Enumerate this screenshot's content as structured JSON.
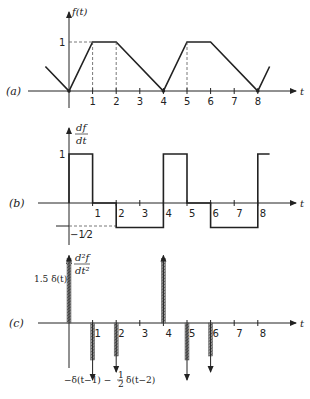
{
  "figure": {
    "panels": [
      {
        "id": "a",
        "label": "(a)",
        "ylabel": "f(t)",
        "xlabel": "t",
        "ytick_labels": [
          "1"
        ],
        "xtick_labels": [
          "1",
          "2",
          "3",
          "4",
          "5",
          "6",
          "7",
          "8"
        ],
        "points": [
          [
            -1,
            0.5
          ],
          [
            0,
            0
          ],
          [
            1,
            1
          ],
          [
            2,
            1
          ],
          [
            4,
            0
          ],
          [
            5,
            1
          ],
          [
            6,
            1
          ],
          [
            8,
            0
          ],
          [
            8.5,
            0.5
          ]
        ]
      },
      {
        "id": "b",
        "label": "(b)",
        "ylabel_num": "df",
        "ylabel_den": "dt",
        "xlabel": "t",
        "ytick_labels": [
          "1",
          "−1⁄2"
        ],
        "xtick_labels": [
          "1",
          "2",
          "3",
          "4",
          "5",
          "6",
          "7",
          "8"
        ],
        "segments": [
          {
            "from": 0,
            "to": 1,
            "value": 1
          },
          {
            "from": 1,
            "to": 2,
            "value": 0
          },
          {
            "from": 2,
            "to": 4,
            "value": -0.5
          },
          {
            "from": 4,
            "to": 5,
            "value": 1
          },
          {
            "from": 5,
            "to": 6,
            "value": 0
          },
          {
            "from": 6,
            "to": 8,
            "value": -0.5
          },
          {
            "from": 8,
            "to": 8.5,
            "value": 1
          }
        ]
      },
      {
        "id": "c",
        "label": "(c)",
        "ylabel_num": "d²f",
        "ylabel_den": "dt²",
        "xlabel": "t",
        "xtick_labels": [
          "1",
          "2",
          "3",
          "4",
          "5",
          "6",
          "7",
          "8"
        ],
        "impulses": [
          {
            "t": 0,
            "weight": 1.5
          },
          {
            "t": 1,
            "weight": -1
          },
          {
            "t": 2,
            "weight": -0.5
          },
          {
            "t": 4,
            "weight": 1.5
          },
          {
            "t": 5,
            "weight": -1
          },
          {
            "t": 6,
            "weight": -0.5
          }
        ],
        "annotations": {
          "top": "1.5 δ(t)",
          "bottom_a": "−δ(t−1) −",
          "bottom_frac_num": "1",
          "bottom_frac_den": "2",
          "bottom_b": "δ(t−2)"
        }
      }
    ]
  },
  "chart_data": [
    {
      "type": "line",
      "title": "(a) f(t)",
      "xlabel": "t",
      "ylabel": "f(t)",
      "x": [
        -1,
        0,
        1,
        2,
        4,
        5,
        6,
        8,
        8.5
      ],
      "values": [
        0.5,
        0,
        1,
        1,
        0,
        1,
        1,
        0,
        0.5
      ],
      "ylim": [
        0,
        1
      ]
    },
    {
      "type": "line",
      "title": "(b) df/dt",
      "xlabel": "t",
      "ylabel": "df/dt",
      "x": [
        0,
        1,
        1,
        2,
        2,
        4,
        4,
        5,
        5,
        6,
        6,
        8,
        8
      ],
      "values": [
        1,
        1,
        0,
        0,
        -0.5,
        -0.5,
        1,
        1,
        0,
        0,
        -0.5,
        -0.5,
        1
      ],
      "ylim": [
        -0.5,
        1
      ]
    },
    {
      "type": "bar",
      "title": "(c) d²f/dt²",
      "xlabel": "t",
      "ylabel": "d²f/dt²",
      "categories": [
        "0",
        "1",
        "2",
        "4",
        "5",
        "6"
      ],
      "values": [
        1.5,
        -1,
        -0.5,
        1.5,
        -1,
        -0.5
      ]
    }
  ]
}
